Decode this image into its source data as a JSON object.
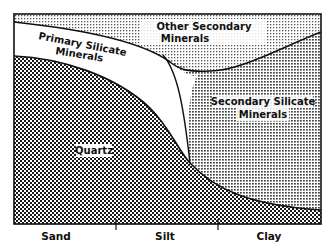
{
  "diagram": {
    "regions": [
      {
        "id": "other-secondary",
        "label_line1": "Other Secondary",
        "label_line2": "Minerals",
        "pattern": "fine-dots"
      },
      {
        "id": "primary-silicate",
        "label_line1": "Primary Silicate",
        "label_line2": "Minerals",
        "pattern": "white"
      },
      {
        "id": "secondary-silicate",
        "label_line1": "Secondary Silicate",
        "label_line2": "Minerals",
        "pattern": "medium-dots"
      },
      {
        "id": "quartz",
        "label_line1": "Quartz",
        "pattern": "coarse-checker"
      }
    ],
    "x_axis": {
      "categories": [
        "Sand",
        "Silt",
        "Clay"
      ]
    },
    "colors": {
      "ink": "#111111",
      "background": "#ffffff"
    }
  }
}
